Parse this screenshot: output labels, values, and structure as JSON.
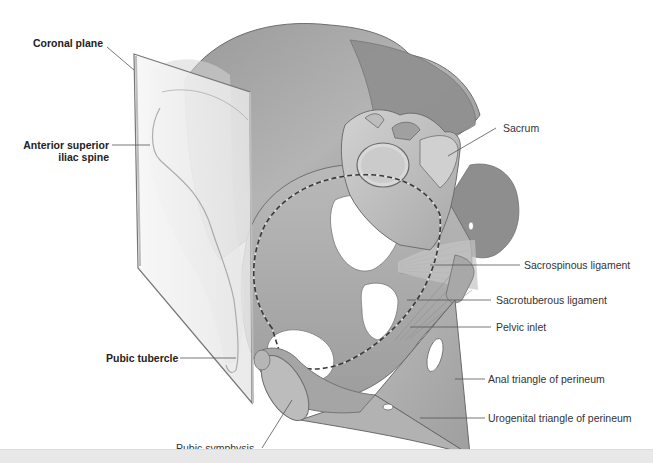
{
  "figure": {
    "colors": {
      "bone_dark": "#8a8a8a",
      "bone_mid": "#a9a9a9",
      "bone_light": "#cfcfcf",
      "plane_fill": "#f2f2f2",
      "plane_edge": "#7a7a7a",
      "label_text": "#333333",
      "leader_line": "#555555",
      "background": "#ffffff",
      "bottom_bar": "#e8e8e8"
    }
  },
  "labels": {
    "left": [
      {
        "id": "coronal-plane",
        "text": "Coronal plane",
        "bold": true
      },
      {
        "id": "asis",
        "text": "Anterior superior",
        "text2": "iliac spine",
        "bold": true
      },
      {
        "id": "pubic-tubercle",
        "text": "Pubic tubercle",
        "bold": true
      },
      {
        "id": "pubic-symphysis",
        "text": "Pubic symphysis",
        "bold": false
      }
    ],
    "right": [
      {
        "id": "sacrum",
        "text": "Sacrum"
      },
      {
        "id": "sacrospinous",
        "text": "Sacrospinous ligament"
      },
      {
        "id": "sacrotuberous",
        "text": "Sacrotuberous ligament"
      },
      {
        "id": "pelvic-inlet",
        "text": "Pelvic inlet"
      },
      {
        "id": "anal-triangle",
        "text": "Anal triangle of perineum"
      },
      {
        "id": "urogenital-triangle",
        "text": "Urogenital triangle of perineum"
      }
    ]
  }
}
